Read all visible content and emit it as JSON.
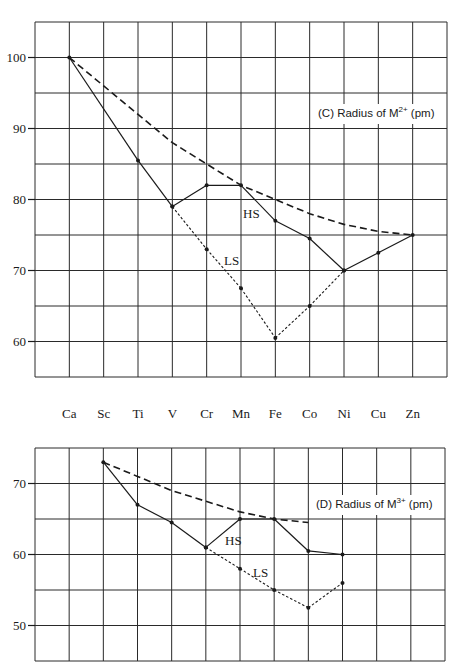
{
  "chart_data": [
    {
      "type": "line",
      "panel_label": "(C)",
      "title": "Radius of M2+ (pm)",
      "title_parts": {
        "prefix": "(C)  Radius of M",
        "sup": "2+",
        "suffix": " (pm)"
      },
      "xlabel": "",
      "ylabel": "",
      "categories": [
        "Ca",
        "Sc",
        "Ti",
        "V",
        "Cr",
        "Mn",
        "Fe",
        "Co",
        "Ni",
        "Cu",
        "Zn"
      ],
      "yticks": [
        100,
        90,
        80,
        70,
        60
      ],
      "ylim": [
        55,
        105
      ],
      "grid": true,
      "series": [
        {
          "name": "spherical-trend",
          "style": "dashed",
          "values": [
            100,
            96,
            92,
            88,
            85,
            82,
            80,
            78,
            76.5,
            75.5,
            75
          ]
        },
        {
          "name": "HS",
          "style": "solid",
          "values": [
            100,
            null,
            85.5,
            79,
            82,
            82,
            77,
            74.5,
            70,
            72.5,
            75
          ]
        },
        {
          "name": "LS",
          "style": "dotted",
          "values": [
            null,
            null,
            null,
            79,
            73,
            67.5,
            60.5,
            65,
            70,
            null,
            null
          ]
        }
      ],
      "annotations": [
        {
          "text": "HS",
          "near": "Mn-Fe"
        },
        {
          "text": "LS",
          "near": "Cr-Mn"
        }
      ]
    },
    {
      "type": "line",
      "panel_label": "(D)",
      "title": "Radius of M3+ (pm)",
      "title_parts": {
        "prefix": "(D)  Radius of M",
        "sup": "3+",
        "suffix": " (pm)"
      },
      "xlabel": "",
      "ylabel": "",
      "categories": [
        "Ca",
        "Sc",
        "Ti",
        "V",
        "Cr",
        "Mn",
        "Fe",
        "Co",
        "Ni",
        "Cu",
        "Zn"
      ],
      "yticks": [
        70,
        60,
        50
      ],
      "ylim": [
        45,
        75
      ],
      "grid": true,
      "series": [
        {
          "name": "spherical-trend",
          "style": "dashed",
          "values": [
            null,
            73,
            71,
            69,
            67.5,
            66,
            65,
            64.5,
            null,
            null,
            null
          ]
        },
        {
          "name": "HS",
          "style": "solid",
          "values": [
            null,
            73,
            67,
            64.5,
            61,
            65,
            65,
            60.5,
            60,
            null,
            null
          ]
        },
        {
          "name": "LS",
          "style": "dotted",
          "values": [
            null,
            null,
            null,
            null,
            61,
            58,
            55,
            52.5,
            56,
            null,
            null
          ]
        }
      ],
      "annotations": [
        {
          "text": "HS",
          "near": "Cr-Mn"
        },
        {
          "text": "LS",
          "near": "Mn-Fe"
        }
      ]
    }
  ],
  "labels": {
    "hs": "HS",
    "ls": "LS"
  },
  "colors": {
    "ink": "#1a1a1a",
    "grid": "#2a2a2a",
    "background": "#ffffff"
  }
}
